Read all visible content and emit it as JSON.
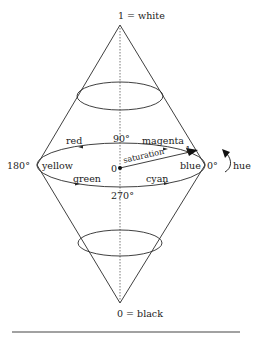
{
  "diagram": {
    "type": "HSV/HSL double cone color model",
    "top_label": "1 = white",
    "bottom_label": "0 = black",
    "center_label": "0",
    "saturation_label": "saturation",
    "saturation_end_label": "1",
    "angles": {
      "a90": "90°",
      "a180": "180°",
      "a270": "270°",
      "a0": "0°"
    },
    "hues": {
      "red": "red",
      "magenta": "magenta",
      "yellow": "yellow",
      "blue": "blue",
      "green": "green",
      "cyan": "cyan"
    },
    "hue_label": "hue",
    "colors": {
      "line": "#2a2a2a",
      "rule": "#444444"
    }
  }
}
